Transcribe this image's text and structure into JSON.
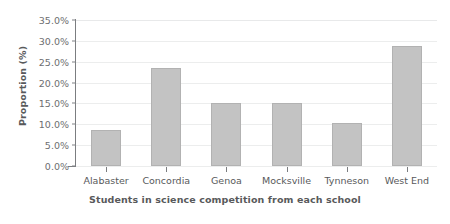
{
  "chart_data": {
    "type": "bar",
    "title": "",
    "subtitle": "",
    "xlabel": "Students in science competition from each school",
    "ylabel": "Proportion (%)",
    "categories": [
      "Alabaster",
      "Concordia",
      "Genoa",
      "Mocksville",
      "Tynneson",
      "West End"
    ],
    "values": [
      8.7,
      23.5,
      15.2,
      15.2,
      10.3,
      28.8
    ],
    "value_labels": [
      "8.7%",
      "23.5%",
      "15.2%",
      "15.2%",
      "10.3%",
      "28.8%"
    ],
    "ylim": [
      0,
      35
    ],
    "ytick_values": [
      0,
      5,
      10,
      15,
      20,
      25,
      30,
      35
    ],
    "ytick_labels": [
      "0.0%",
      "5.0%",
      "10.0%",
      "15.0%",
      "20.0%",
      "25.0%",
      "30.0%",
      "35.0%"
    ],
    "grid": "horizontal",
    "legend": "none",
    "bar_color": "#c3c3c3",
    "bar_border_color": "#b2b2b2",
    "gridline_color": "#eceded",
    "axis_color": "#7b7d80",
    "text_color": "#58595b",
    "background": "#ffffff"
  }
}
